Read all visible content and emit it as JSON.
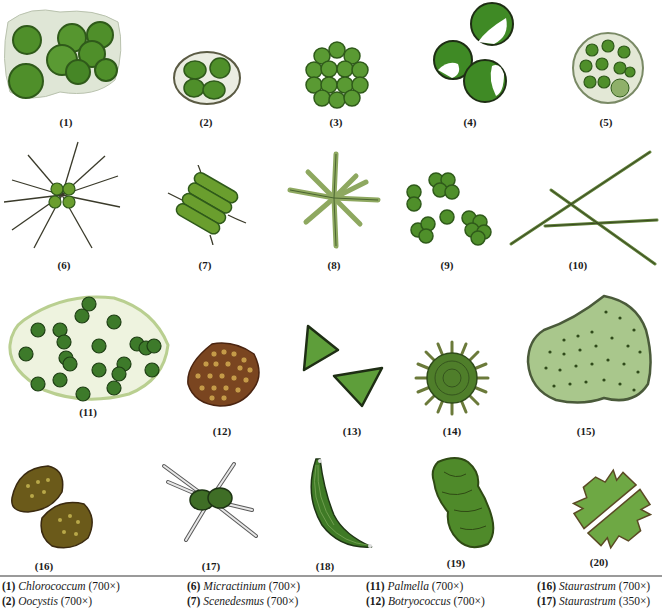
{
  "figure": {
    "labels": [
      "(1)",
      "(2)",
      "(3)",
      "(4)",
      "(5)",
      "(6)",
      "(7)",
      "(8)",
      "(9)",
      "(10)",
      "(11)",
      "(12)",
      "(13)",
      "(14)",
      "(15)",
      "(16)",
      "(17)",
      "(18)",
      "(19)",
      "(20)"
    ],
    "colors": {
      "cell_green": "#4f8f2a",
      "cell_dark": "#2f5a1a",
      "matrix_pale": "#e4ecd2",
      "brown": "#6b3a1a",
      "spine": "#3a3a2a"
    }
  },
  "legend": {
    "columns": [
      [
        {
          "num": "(1)",
          "name": "Chlorococcum",
          "mag": "(700×)"
        },
        {
          "num": "(2)",
          "name": "Oocystis",
          "mag": "(700×)"
        }
      ],
      [
        {
          "num": "(6)",
          "name": "Micractinium",
          "mag": "(700×)"
        },
        {
          "num": "(7)",
          "name": "Scenedesmus",
          "mag": "(700×)"
        }
      ],
      [
        {
          "num": "(11)",
          "name": "Palmella",
          "mag": "(700×)"
        },
        {
          "num": "(12)",
          "name": "Botryococcus",
          "mag": "(700×)"
        }
      ],
      [
        {
          "num": "(16)",
          "name": "Staurastrum",
          "mag": "(700×)"
        },
        {
          "num": "(17)",
          "name": "Staurastrum",
          "mag": "(350×)"
        }
      ]
    ]
  }
}
